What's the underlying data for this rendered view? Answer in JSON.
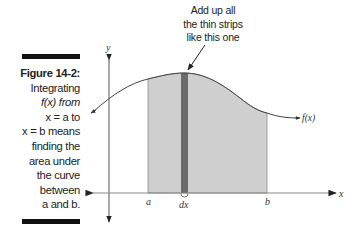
{
  "figure": {
    "label": "Figure 14-2:",
    "caption_lines": [
      "Integrating",
      "f(x) from",
      "x = a to",
      "x = b means",
      "finding the",
      "area under",
      "the curve",
      "between",
      "a and b."
    ]
  },
  "annotation": {
    "lines": [
      "Add up all",
      "the thin strips",
      "like this one"
    ]
  },
  "diagram": {
    "axis_x_label": "x",
    "axis_y_label": "y",
    "curve_label": "f(x)",
    "lower_bound_label": "a",
    "upper_bound_label": "b",
    "strip_label": "dx",
    "colors": {
      "area_fill": "#cfcfcf",
      "strip_fill": "#6b6b6b",
      "axis": "#555555",
      "curve": "#444444"
    }
  }
}
